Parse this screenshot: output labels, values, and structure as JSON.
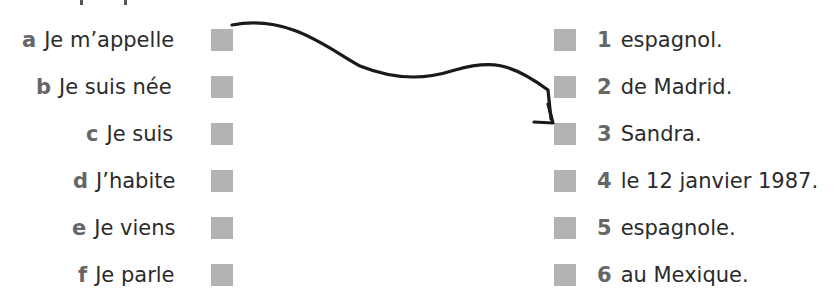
{
  "exercise": {
    "left_items": [
      {
        "letter": "a",
        "text": "Je m’appelle"
      },
      {
        "letter": "b",
        "text": "Je suis née"
      },
      {
        "letter": "c",
        "text": "Je suis"
      },
      {
        "letter": "d",
        "text": "J’habite"
      },
      {
        "letter": "e",
        "text": "Je viens"
      },
      {
        "letter": "f",
        "text": "Je parle"
      }
    ],
    "right_items": [
      {
        "number": "1",
        "text": "espagnol."
      },
      {
        "number": "2",
        "text": "de Madrid."
      },
      {
        "number": "3",
        "text": "Sandra."
      },
      {
        "number": "4",
        "text": "le 12 janvier 1987."
      },
      {
        "number": "5",
        "text": "espagnole."
      },
      {
        "number": "6",
        "text": "au Mexique."
      }
    ],
    "example_link": {
      "from": "a",
      "to": "3"
    },
    "colors": {
      "box": "#b3b3b3",
      "label": "#666666",
      "text": "#2b2b2b",
      "arrow": "#1a1a1a"
    }
  }
}
